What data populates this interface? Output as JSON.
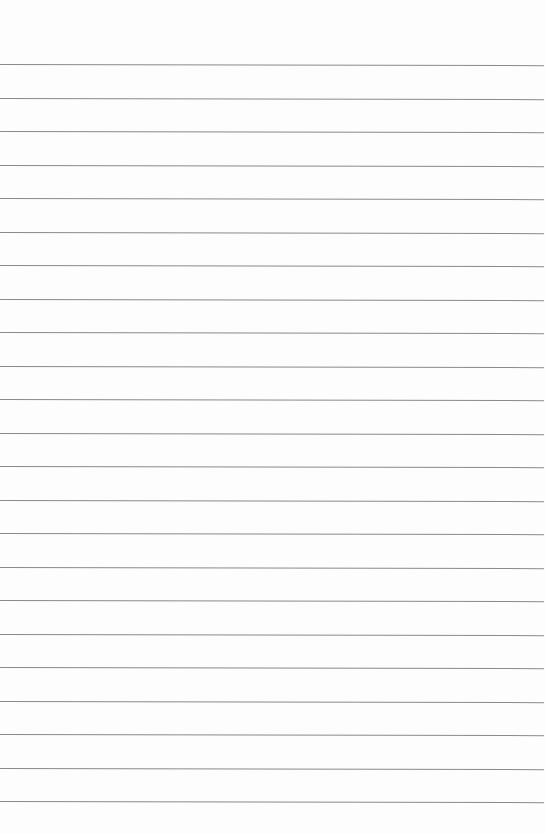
{
  "page": {
    "type": "lined-paper",
    "background_color": "#fdfdfd",
    "line_color": "#8a8a8a",
    "line_count": 23,
    "first_line_y": 64,
    "line_spacing": 33.5,
    "content": ""
  }
}
